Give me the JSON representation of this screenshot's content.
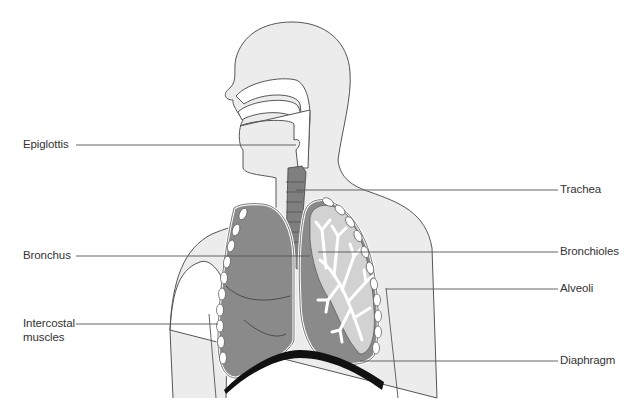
{
  "colors": {
    "skin": "#ececec",
    "outline": "#555555",
    "lung_dark": "#8a8a8a",
    "lung_light": "#d2d2d2",
    "trachea": "#7f7f7f",
    "diaphragm": "#111111",
    "leader_line": "#555555",
    "text": "#333333"
  },
  "labels": {
    "left": [
      {
        "id": "epiglottis",
        "text": "Epiglottis"
      },
      {
        "id": "bronchus",
        "text": "Bronchus"
      },
      {
        "id": "intercostal",
        "text": "Intercostal",
        "text2": "muscles"
      }
    ],
    "right": [
      {
        "id": "trachea",
        "text": "Trachea"
      },
      {
        "id": "bronchioles",
        "text": "Bronchioles"
      },
      {
        "id": "alveoli",
        "text": "Alveoli"
      },
      {
        "id": "diaphragm",
        "text": "Diaphragm"
      }
    ]
  }
}
